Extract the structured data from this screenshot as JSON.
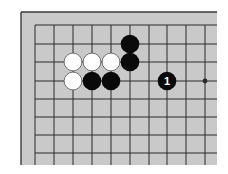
{
  "diagram": {
    "type": "go-board-partial",
    "colors": {
      "page_background": "#ffffff",
      "board": "#c9c9c9",
      "grid_line": "#2a2a2a",
      "edge_line": "#3a3a3a",
      "black_stone": "#0a0a0a",
      "white_stone": "#ffffff",
      "white_stone_outline": "#555555",
      "label_on_black": "#ffffff"
    },
    "board_area": {
      "x": 21,
      "y": 12,
      "width": 196,
      "height": 153
    },
    "grid": {
      "x_lines": [
        35,
        54,
        73,
        92,
        111,
        130,
        149,
        167,
        186,
        205
      ],
      "y_lines": [
        25,
        44,
        62,
        81,
        99,
        117,
        135,
        153
      ],
      "extend_right": 217,
      "extend_bottom": 165
    },
    "star_points": [
      {
        "col": 9,
        "row": 3
      }
    ],
    "stones": [
      {
        "color": "black",
        "col": 5,
        "row": 1,
        "label": ""
      },
      {
        "color": "white",
        "col": 2,
        "row": 2,
        "label": ""
      },
      {
        "color": "white",
        "col": 3,
        "row": 2,
        "label": ""
      },
      {
        "color": "white",
        "col": 4,
        "row": 2,
        "label": ""
      },
      {
        "color": "black",
        "col": 5,
        "row": 2,
        "label": ""
      },
      {
        "color": "white",
        "col": 2,
        "row": 3,
        "label": ""
      },
      {
        "color": "black",
        "col": 3,
        "row": 3,
        "label": ""
      },
      {
        "color": "black",
        "col": 4,
        "row": 3,
        "label": ""
      },
      {
        "color": "black",
        "col": 7,
        "row": 3,
        "label": "1"
      }
    ],
    "stone_radius": 9.3
  }
}
